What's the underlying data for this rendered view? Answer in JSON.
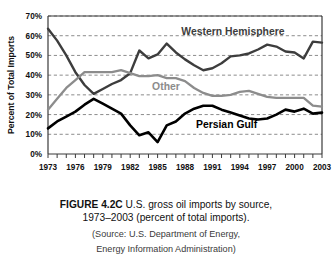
{
  "figure": {
    "number": "FIGURE 4.2C",
    "title_text": "U.S. gross oil imports by source,",
    "title_line2": "1973–2003 (percent of total imports).",
    "source_line1": "(Source: U.S. Department of Energy,",
    "source_line2": "Energy Information Administration)"
  },
  "axes": {
    "ylabel": "Percent of Total Imports",
    "yticks": [
      "0%",
      "10%",
      "20%",
      "30%",
      "40%",
      "50%",
      "60%",
      "70%"
    ],
    "xticks": [
      "1973",
      "1976",
      "1979",
      "1982",
      "1985",
      "1988",
      "1991",
      "1994",
      "1997",
      "2000",
      "2003"
    ]
  },
  "labels": {
    "western": "Western Hemisphere",
    "other": "Other",
    "gulf": "Persian Gulf"
  },
  "colors": {
    "western": "#3d3d3d",
    "other": "#8c8c8c",
    "gulf": "#000000",
    "grid": "#6f6f6f",
    "axis": "#3a3a3a",
    "background": "#ffffff"
  },
  "chart_data": {
    "type": "line",
    "title": "U.S. gross oil imports by source, 1973–2003 (percent of total imports)",
    "xlabel": "",
    "ylabel": "Percent of Total Imports",
    "xlim": [
      1973,
      2003
    ],
    "ylim": [
      0,
      70
    ],
    "grid": true,
    "legend": "inline-annotations",
    "x": [
      1973,
      1974,
      1975,
      1976,
      1977,
      1978,
      1979,
      1980,
      1981,
      1982,
      1983,
      1984,
      1985,
      1986,
      1987,
      1988,
      1989,
      1990,
      1991,
      1992,
      1993,
      1994,
      1995,
      1996,
      1997,
      1998,
      1999,
      2000,
      2001,
      2002,
      2003
    ],
    "series": [
      {
        "name": "Western Hemisphere",
        "color": "#3d3d3d",
        "values": [
          63.5,
          57.5,
          50.0,
          41.5,
          35.0,
          30.5,
          33.0,
          35.5,
          37.5,
          41.0,
          52.5,
          48.5,
          50.5,
          56.0,
          51.5,
          48.0,
          45.0,
          42.5,
          43.5,
          46.0,
          49.5,
          50.0,
          51.0,
          53.0,
          55.5,
          54.5,
          52.0,
          51.5,
          48.5,
          57.0,
          56.5
        ]
      },
      {
        "name": "Other",
        "color": "#8c8c8c",
        "values": [
          22.5,
          28.0,
          33.5,
          37.5,
          41.5,
          41.5,
          41.5,
          41.5,
          42.5,
          41.0,
          39.5,
          39.5,
          40.0,
          38.5,
          38.5,
          37.0,
          33.5,
          31.0,
          29.5,
          29.5,
          30.0,
          31.5,
          32.0,
          30.5,
          29.0,
          28.5,
          28.5,
          28.5,
          28.5,
          24.5,
          24.0
        ]
      },
      {
        "name": "Persian Gulf",
        "color": "#000000",
        "values": [
          13.0,
          16.5,
          19.0,
          21.5,
          25.0,
          28.0,
          25.5,
          23.0,
          20.5,
          14.5,
          9.5,
          11.0,
          6.0,
          14.5,
          16.5,
          20.5,
          23.0,
          24.5,
          24.5,
          22.5,
          21.0,
          19.5,
          18.0,
          17.5,
          18.0,
          20.0,
          22.5,
          21.5,
          23.0,
          20.5,
          21.0
        ]
      }
    ]
  }
}
